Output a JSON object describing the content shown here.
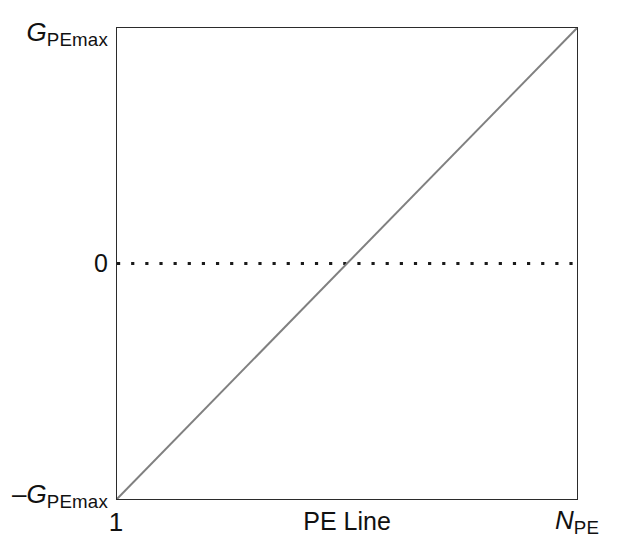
{
  "chart_data": {
    "type": "line",
    "title": "",
    "subtitle": "",
    "xlabel": "PE Line",
    "ylabel": "",
    "x_tick_labels": [
      "1",
      "N_PE"
    ],
    "y_tick_labels": [
      "G_PEmax",
      "0",
      "-G_PEmax"
    ],
    "xlim": [
      "1",
      "N_PE"
    ],
    "ylim": [
      "-G_PEmax",
      "G_PEmax"
    ],
    "grid": false,
    "legend": null,
    "series": [
      {
        "name": "gradient ramp",
        "style": "solid",
        "color": "#808080",
        "x": [
          0,
          1
        ],
        "y": [
          -1,
          1
        ],
        "points": [
          {
            "x_label": "1",
            "y_label": "-G_PEmax",
            "x_frac": 0,
            "y_frac": -1
          },
          {
            "x_label": "N_PE",
            "y_label": "G_PEmax",
            "x_frac": 1,
            "y_frac": 1
          }
        ]
      },
      {
        "name": "zero reference line",
        "style": "dotted",
        "color": "#1a1a1a",
        "x": [
          0,
          1
        ],
        "y": [
          0,
          0
        ],
        "points": [
          {
            "x_label": "1",
            "y_label": "0",
            "x_frac": 0,
            "y_frac": 0
          },
          {
            "x_label": "N_PE",
            "y_label": "0",
            "x_frac": 1,
            "y_frac": 0
          }
        ]
      }
    ],
    "annotations": []
  },
  "axes": {
    "y": {
      "top": {
        "variable": "G",
        "subscript": "PEmax",
        "sign": ""
      },
      "middle": {
        "value": "0"
      },
      "bottom": {
        "variable": "G",
        "subscript": "PEmax",
        "sign": "–"
      }
    },
    "x": {
      "left": {
        "value": "1"
      },
      "title": "PE Line",
      "right": {
        "variable": "N",
        "subscript": "PE"
      }
    }
  },
  "colors": {
    "frame": "#2b2b2b",
    "ramp_line": "#808080",
    "zero_line": "#1a1a1a",
    "background": "#ffffff",
    "text": "#111111"
  }
}
